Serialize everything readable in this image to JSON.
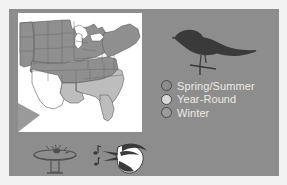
{
  "panel": {
    "background_color": "#8d8d8d",
    "outer_background_color": "#f2f2f2"
  },
  "map": {
    "name": "united-states-range-map",
    "background_color": "#ffffff",
    "land_outline_color": "#5b5b5b",
    "regions": [
      {
        "id": "spring-summer",
        "label": "Spring/Summer",
        "fill": "#8f8f8f"
      },
      {
        "id": "year-round",
        "label": "Year-Round",
        "fill": "#bdbdbd"
      },
      {
        "id": "winter",
        "label": "Winter",
        "fill": "#8f8f8f"
      }
    ],
    "corner_marker_color": "#9a9a9a"
  },
  "legend": {
    "name": "range-legend",
    "text_color": "#eceae6",
    "outline_color": "#4a4a4a",
    "items": [
      {
        "label": "Spring/Summer",
        "swatch_color": "#8d8d8d"
      },
      {
        "label": "Year-Round",
        "swatch_color": "#d9d9d9"
      },
      {
        "label": "Winter",
        "swatch_color": "#9b9b9b"
      }
    ]
  },
  "artwork": {
    "bird_silhouette": {
      "name": "perched-bird-silhouette",
      "color": "#3a3a3a"
    },
    "birdbath_icon": {
      "name": "birdbath-icon",
      "color": "#4f4f4f"
    },
    "birdsong_icon": {
      "name": "singing-bird-icon",
      "color": "#3a3a3a",
      "notes_label": "music-notes"
    }
  }
}
